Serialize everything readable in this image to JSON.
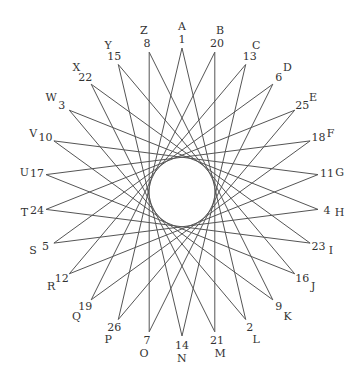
{
  "diagram": {
    "type": "star-polygon cipher wheel",
    "center": [
      182,
      192
    ],
    "radius_x": 137,
    "radius_y": 144,
    "skip": 11,
    "line_color": "#555555",
    "points": [
      {
        "letter": "A",
        "number": "1"
      },
      {
        "letter": "B",
        "number": "20"
      },
      {
        "letter": "C",
        "number": "13"
      },
      {
        "letter": "D",
        "number": "6"
      },
      {
        "letter": "E",
        "number": "25"
      },
      {
        "letter": "F",
        "number": "18"
      },
      {
        "letter": "G",
        "number": "11"
      },
      {
        "letter": "H",
        "number": "4"
      },
      {
        "letter": "I",
        "number": "23"
      },
      {
        "letter": "J",
        "number": "16"
      },
      {
        "letter": "K",
        "number": "9"
      },
      {
        "letter": "L",
        "number": "2"
      },
      {
        "letter": "M",
        "number": "21"
      },
      {
        "letter": "N",
        "number": "14"
      },
      {
        "letter": "O",
        "number": "7"
      },
      {
        "letter": "P",
        "number": "26"
      },
      {
        "letter": "Q",
        "number": "19"
      },
      {
        "letter": "R",
        "number": "12"
      },
      {
        "letter": "S",
        "number": "5"
      },
      {
        "letter": "T",
        "number": "24"
      },
      {
        "letter": "U",
        "number": "17"
      },
      {
        "letter": "V",
        "number": "10"
      },
      {
        "letter": "W",
        "number": "3"
      },
      {
        "letter": "X",
        "number": "22"
      },
      {
        "letter": "Y",
        "number": "15"
      },
      {
        "letter": "Z",
        "number": "8"
      }
    ]
  }
}
